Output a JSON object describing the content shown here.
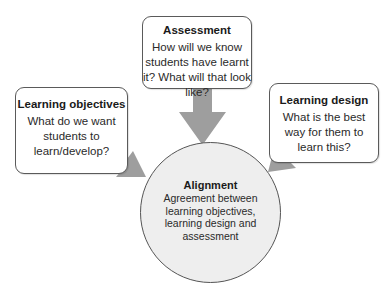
{
  "diagram": {
    "assessment": {
      "title": "Assessment",
      "body": "How will we know students have learnt it? What will that look like?"
    },
    "learning_objectives": {
      "title": "Learning objectives",
      "body": "What do we want students to learn/develop?"
    },
    "learning_design": {
      "title": "Learning design",
      "body": "What is the best way for them to learn this?"
    },
    "alignment": {
      "title": "Alignment",
      "body": "Agreement between learning objectives, learning design and assessment"
    },
    "colors": {
      "arrow": "#9e9e9e",
      "circle_fill": "#eeeeee",
      "border": "#5a5a5a"
    }
  }
}
